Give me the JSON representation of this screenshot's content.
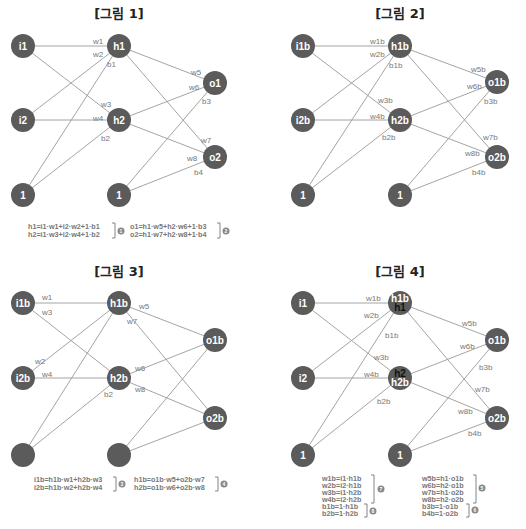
{
  "figures": [
    {
      "title": "[그림 1]",
      "nodes": {
        "i1": "i1",
        "i2": "i2",
        "h1": "h1",
        "h2": "h2",
        "o1": "o1",
        "o2": "o2",
        "bias_in": "1",
        "bias_hid": "1"
      },
      "edges": {
        "w1": "w1",
        "w2": "w2",
        "w3": "w3",
        "w4": "w4",
        "w5": "w5",
        "w6": "w6",
        "w7": "w7",
        "w8": "w8",
        "b1": "b1",
        "b2": "b2",
        "b3": "b3",
        "b4": "b4"
      },
      "formulas": [
        {
          "lines": [
            "h1=i1·w1+i2·w2+1·b1",
            "h2=i1·w3+i2·w4+1·b2"
          ],
          "badge": "1"
        },
        {
          "lines": [
            "o1=h1·w5+h2·w6+1·b3",
            "o2=h1·w7+h2·w8+1·b4"
          ],
          "badge": "2"
        }
      ]
    },
    {
      "title": "[그림 2]",
      "nodes": {
        "i1": "i1b",
        "i2": "i2b",
        "h1": "h1b",
        "h2": "h2b",
        "o1": "o1b",
        "o2": "o2b",
        "bias_in": "1",
        "bias_hid": "1"
      },
      "edges": {
        "w1": "w1b",
        "w2": "w2b",
        "w3": "w3b",
        "w4": "w4b",
        "w5": "w5b",
        "w6": "w6b",
        "w7": "w7b",
        "w8": "w8b",
        "b1": "b1b",
        "b2": "b2b",
        "b3": "b3b",
        "b4": "b4b"
      }
    },
    {
      "title": "[그림 3]",
      "nodes": {
        "i1": "i1b",
        "i2": "i2b",
        "h1": "h1b",
        "h2": "h2b",
        "o1": "o1b",
        "o2": "o2b",
        "bias_in": "",
        "bias_hid": ""
      },
      "edges": {
        "w1": "w1",
        "w2": "w2",
        "w3": "w3",
        "w4": "w4",
        "w5": "w5",
        "w6": "w6",
        "w7": "w7",
        "w8": "w8",
        "b2": "b2"
      },
      "formulas": [
        {
          "lines": [
            "i1b=h1b·w1+h2b·w3",
            "i2b=h1b·w2+h2b·w4"
          ],
          "badge": "3"
        },
        {
          "lines": [
            "h1b=o1b·w5+o2b·w7",
            "h2b=o1b·w6+o2b·w8"
          ],
          "badge": "4"
        }
      ]
    },
    {
      "title": "[그림 4]",
      "nodes": {
        "i1": "i1",
        "i2": "i2",
        "h1_top": "h1b",
        "h1_bottom": "h1",
        "h2_top": "h2",
        "h2_bottom": "h2b",
        "o1": "o1b",
        "o2": "o2b",
        "bias_in": "1",
        "bias_hid": "1"
      },
      "edges": {
        "w1": "w1b",
        "w2": "w2b",
        "w3": "w3b",
        "w4": "w4b",
        "w5": "w5b",
        "w6": "w6b",
        "w7": "w7b",
        "w8": "w8b",
        "b1": "b1b",
        "b2": "b2b",
        "b3": "b3b",
        "b4": "b4b"
      },
      "formulas": [
        {
          "lines": [
            "w1b=i1·h1b",
            "w2b=i2·h1b",
            "w3b=i1·h2b",
            "w4b=i2·h2b"
          ],
          "badge": "7"
        },
        {
          "lines": [
            "b1b=1·h1b",
            "b2b=1·h2b"
          ],
          "badge": "8"
        },
        {
          "lines": [
            "w5b=h1·o1b",
            "w6b=h2·o1b",
            "w7b=h1·o2b",
            "w8b=h2·o2b"
          ],
          "badge": "5"
        },
        {
          "lines": [
            "b3b=1·o1b",
            "b4b=1·o2b"
          ],
          "badge": "6"
        }
      ]
    }
  ],
  "colors": {
    "node": "#5b5b5b",
    "edge": "#9a9a9a",
    "edge_label": "#777777",
    "title": "#222222"
  }
}
